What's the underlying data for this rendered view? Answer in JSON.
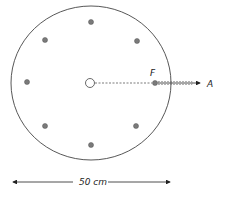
{
  "diagram": {
    "labels": {
      "point_f": "F",
      "point_a": "A",
      "diameter": "50 cm"
    },
    "colors": {
      "outline": "#444444",
      "dots": "#7a7a7a",
      "text": "#222222"
    },
    "dots": [
      {
        "name": "top",
        "x": 91,
        "y": 22
      },
      {
        "name": "upper-left",
        "x": 45,
        "y": 40
      },
      {
        "name": "upper-right",
        "x": 137,
        "y": 41
      },
      {
        "name": "left",
        "x": 27,
        "y": 82
      },
      {
        "name": "lower-left",
        "x": 45,
        "y": 126
      },
      {
        "name": "lower-right",
        "x": 136,
        "y": 126
      },
      {
        "name": "bottom",
        "x": 91,
        "y": 145
      }
    ]
  }
}
